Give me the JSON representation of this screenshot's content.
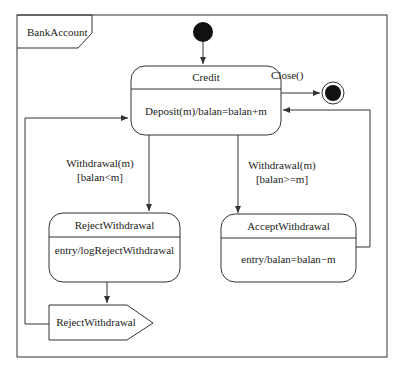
{
  "diagram": {
    "type": "UML state machine",
    "frame_title": "BankAccount",
    "states": [
      {
        "id": "credit",
        "name": "Credit",
        "activity": "Deposit(m)/balan=balan+m"
      },
      {
        "id": "reject",
        "name": "RejectWithdrawal",
        "activity": "entry/logRejectWithdrawal"
      },
      {
        "id": "accept",
        "name": "AcceptWithdrawal",
        "activity": "entry/balan=balan−m"
      }
    ],
    "signal": {
      "label": "RejectWithdrawal"
    },
    "transitions": [
      {
        "from": "initial",
        "to": "credit",
        "label": ""
      },
      {
        "from": "credit",
        "to": "final",
        "label": "Close()"
      },
      {
        "from": "credit",
        "to": "reject",
        "label_line1": "Withdrawal(m)",
        "label_line2": "[balan<m]"
      },
      {
        "from": "credit",
        "to": "accept",
        "label_line1": "Withdrawal(m)",
        "label_line2": "[balan>=m]"
      },
      {
        "from": "reject",
        "to": "signal",
        "label": ""
      },
      {
        "from": "signal",
        "to": "credit",
        "label": ""
      },
      {
        "from": "accept",
        "to": "credit",
        "label": ""
      }
    ],
    "colors": {
      "line": "#333333",
      "fill": "#ffffff",
      "node": "#111111"
    }
  }
}
